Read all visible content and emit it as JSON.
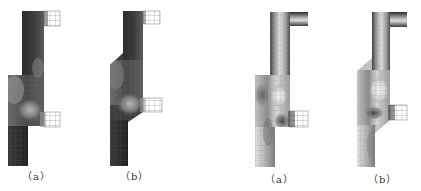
{
  "figure": {
    "panels": [
      {
        "id": "left-a",
        "label": "（a）",
        "field": "dark",
        "geometry": "straight-step"
      },
      {
        "id": "left-b",
        "label": "（b）",
        "field": "dark",
        "geometry": "chamfered-step"
      },
      {
        "id": "right-a",
        "label": "（a）",
        "field": "light",
        "geometry": "straight-step"
      },
      {
        "id": "right-b",
        "label": "（b）",
        "field": "light",
        "geometry": "chamfered-step"
      }
    ]
  },
  "labels": {
    "left_a": "（a）",
    "left_b": "（b）",
    "right_a": "（a）",
    "right_b": "（b）"
  },
  "colors": {
    "dark_field": "#2a2a2a",
    "mid_field": "#6e6e6e",
    "light_field": "#d8d8d8",
    "mesh": "#8a8a8a",
    "background": "#ffffff"
  }
}
